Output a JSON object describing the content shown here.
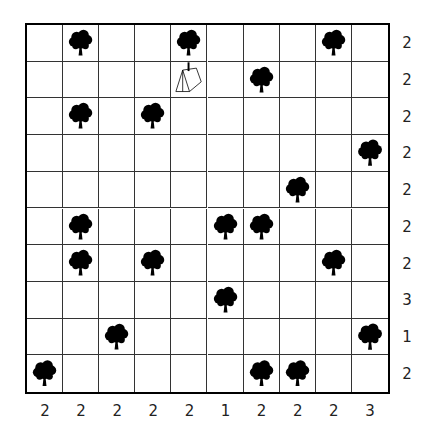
{
  "puzzle": {
    "name": "Tents",
    "rows": 10,
    "cols": 10,
    "row_clues": [
      "2",
      "2",
      "2",
      "2",
      "2",
      "2",
      "2",
      "3",
      "1",
      "2"
    ],
    "col_clues": [
      "2",
      "2",
      "2",
      "2",
      "2",
      "1",
      "2",
      "2",
      "2",
      "3"
    ],
    "trees": [
      [
        0,
        1
      ],
      [
        0,
        4
      ],
      [
        0,
        8
      ],
      [
        1,
        6
      ],
      [
        2,
        1
      ],
      [
        2,
        3
      ],
      [
        3,
        9
      ],
      [
        4,
        7
      ],
      [
        5,
        1
      ],
      [
        5,
        5
      ],
      [
        5,
        6
      ],
      [
        6,
        1
      ],
      [
        6,
        3
      ],
      [
        6,
        8
      ],
      [
        7,
        5
      ],
      [
        8,
        2
      ],
      [
        8,
        9
      ],
      [
        9,
        0
      ],
      [
        9,
        6
      ],
      [
        9,
        7
      ]
    ],
    "tents": [
      {
        "row": 1,
        "col": 4,
        "linked_tree": [
          0,
          4
        ]
      }
    ]
  },
  "colors": {
    "tree": "#000000",
    "grid_line": "#333333",
    "background": "#ffffff",
    "clue_text": "#222222"
  }
}
